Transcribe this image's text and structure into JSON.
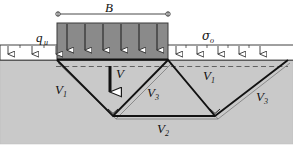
{
  "figure": {
    "colors": {
      "soil_fill": "#c9c9c9",
      "footing_fill": "#8a8a8a",
      "line": "#1a1a1a",
      "background": "#ffffff",
      "arrow_fill": "#ffffff",
      "dashed_line": "#4a4a4a"
    },
    "labels": {
      "width_dimension": "B",
      "applied_pressure": "q",
      "applied_pressure_sub": "u",
      "surcharge": "σ",
      "surcharge_sub": "o",
      "load_resultant": "V",
      "wedge_left": "V",
      "wedge_left_sub": "1",
      "wedge_right": "V",
      "wedge_right_sub": "1",
      "wedge_base": "V",
      "wedge_base_sub": "2",
      "wedge_radial_center": "V",
      "wedge_radial_center_sub": "3",
      "wedge_radial_right": "V",
      "wedge_radial_right_sub": "3"
    },
    "counts": {
      "footing_pressure_arrows": 6,
      "surcharge_arrows_left": 3,
      "surcharge_arrows_right": 5
    },
    "geometry_note": {
      "ground_surface_y": 60,
      "footing_left_x": 57,
      "footing_right_x": 168,
      "wedge_apex_left_x": 113,
      "wedge_apex_right_x": 215,
      "wedge_apex_y": 116
    }
  }
}
